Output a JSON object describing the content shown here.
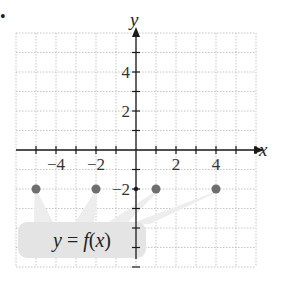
{
  "figure": {
    "marker": "•",
    "colors": {
      "grid": "#c4c4c4",
      "axis": "#1a1a1a",
      "point": "#6e6e6e",
      "callout_fill": "#e4e4e4",
      "callout_wedge": "#ededed"
    }
  },
  "axes": {
    "x_name": "x",
    "y_name": "y",
    "x_tick_labels": [
      {
        "value": -4,
        "label": "−4"
      },
      {
        "value": -2,
        "label": "−2"
      },
      {
        "value": 2,
        "label": "2"
      },
      {
        "value": 4,
        "label": "4"
      }
    ],
    "y_tick_labels": [
      {
        "value": 4,
        "label": "4"
      },
      {
        "value": 2,
        "label": "2"
      },
      {
        "value": -2,
        "label": "−2"
      }
    ],
    "xlim": [
      -6,
      6
    ],
    "ylim": [
      -6,
      6
    ]
  },
  "callout": {
    "label": "y = f(x)",
    "label_y": "y",
    "label_eq": " = ",
    "label_f": "f",
    "label_paren_open": "(",
    "label_x": "x",
    "label_paren_close": ")"
  },
  "chart_data": {
    "type": "scatter",
    "title": "",
    "xlabel": "x",
    "ylabel": "y",
    "x": [
      -5,
      -2,
      1,
      4
    ],
    "y": [
      -2,
      -2,
      -2,
      -2
    ],
    "series": [
      {
        "name": "y = f(x)",
        "points": [
          [
            -5,
            -2
          ],
          [
            -2,
            -2
          ],
          [
            1,
            -2
          ],
          [
            4,
            -2
          ]
        ]
      }
    ],
    "xlim": [
      -6,
      6
    ],
    "ylim": [
      -6,
      6
    ],
    "x_ticks_labeled": [
      -4,
      -2,
      2,
      4
    ],
    "y_ticks_labeled": [
      4,
      2,
      -2
    ],
    "grid": true,
    "annotations": [
      "y = f(x)"
    ]
  }
}
